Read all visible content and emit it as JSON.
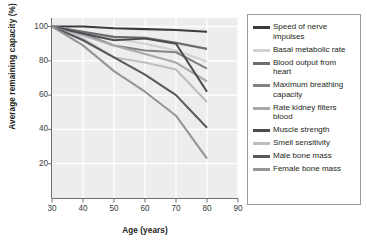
{
  "chart_data": {
    "type": "line",
    "title": "",
    "xlabel": "Age (years)",
    "ylabel": "Average remaining capacity (%)",
    "xlim": [
      30,
      90
    ],
    "ylim": [
      0,
      105
    ],
    "xticks": [
      30,
      40,
      50,
      60,
      70,
      80,
      90
    ],
    "yticks": [
      20,
      40,
      60,
      80,
      100
    ],
    "grid": true,
    "legend_position": "right",
    "x": [
      30,
      40,
      50,
      60,
      70,
      80
    ],
    "series": [
      {
        "name": "Speed of nerve impulses",
        "color": "#3b3b3f",
        "values": [
          100,
          100,
          99,
          98.5,
          98,
          97
        ]
      },
      {
        "name": "Basal metabolic rate",
        "color": "#d0d2d3",
        "values": [
          100,
          97,
          93,
          90,
          86,
          79.5
        ]
      },
      {
        "name": "Blood output from heart",
        "color": "#6d6e71",
        "values": [
          100,
          97,
          94,
          93.5,
          90.5,
          87
        ]
      },
      {
        "name": "Maximum breathing capacity",
        "color": "#808285",
        "values": [
          100,
          96,
          89,
          86,
          85,
          75.5
        ]
      },
      {
        "name": "Rate kidney filters blood",
        "color": "#a7a9ac",
        "values": [
          100,
          95,
          89,
          84,
          79,
          68
        ]
      },
      {
        "name": "Muscle strength",
        "color": "#4d4d4f",
        "values": [
          100,
          96,
          92,
          93,
          90,
          62
        ]
      },
      {
        "name": "Smell sensitivity",
        "color": "#bcbec0",
        "values": [
          100,
          93,
          82,
          79,
          75,
          56
        ]
      },
      {
        "name": "Male bone mass",
        "color": "#58595b",
        "values": [
          100,
          92,
          82,
          72,
          60,
          41
        ]
      },
      {
        "name": "Female bone mass",
        "color": "#939598",
        "values": [
          100,
          89,
          74,
          62,
          48,
          23
        ]
      }
    ],
    "axis_color": "#6d6e71",
    "plot_background": "#eceded",
    "grid_color": "#ffffff"
  }
}
